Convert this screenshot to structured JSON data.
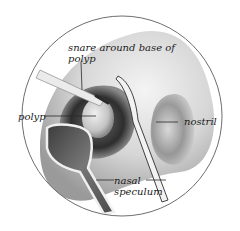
{
  "figure": {
    "labels": {
      "snare": "snare around base of polyp",
      "polyp": "polyp",
      "nostril": "nostril",
      "speculum": "nasal speculum"
    },
    "colors": {
      "background": "#ffffff",
      "circle_outline": "#6e6e6e",
      "tissue_light": "#e6e6e6",
      "tissue_mid": "#b8b8b8",
      "tissue_dark": "#3a3a3a",
      "instrument": "#f2f2f2",
      "leader_line": "#2a2a2a",
      "text": "#1a1a1a"
    }
  }
}
